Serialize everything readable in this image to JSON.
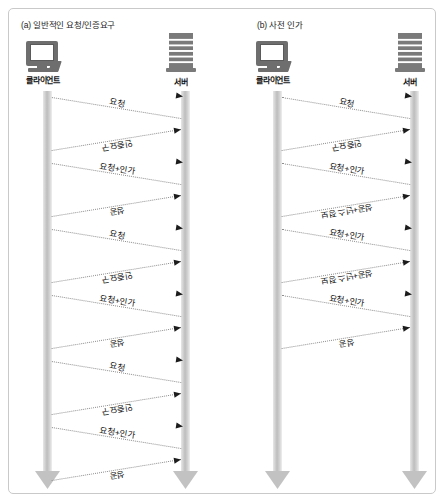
{
  "figure": {
    "background": "#ffffff",
    "border_color": "#c9c9c9",
    "lifeline_color": "#bdbdbd",
    "arrow_color": "#1c1c1c",
    "text_color": "#111111"
  },
  "panels": [
    {
      "id": "a",
      "title": "(a) 일반적인 요청/인증요구",
      "actors": {
        "client": {
          "label": "클라이언트",
          "icon": "monitor-icon"
        },
        "server": {
          "label": "서버",
          "icon": "server-rack-icon"
        }
      },
      "messages": [
        {
          "label": "요청",
          "direction": "client-to-server"
        },
        {
          "label": "인증요구",
          "direction": "server-to-client"
        },
        {
          "label": "요청+인가",
          "direction": "client-to-server"
        },
        {
          "label": "성공",
          "direction": "server-to-client"
        },
        {
          "label": "요청",
          "direction": "client-to-server"
        },
        {
          "label": "인증요구",
          "direction": "server-to-client"
        },
        {
          "label": "요청+인가",
          "direction": "client-to-server"
        },
        {
          "label": "성공",
          "direction": "server-to-client"
        },
        {
          "label": "요청",
          "direction": "client-to-server"
        },
        {
          "label": "인증요구",
          "direction": "server-to-client"
        },
        {
          "label": "요청+인가",
          "direction": "client-to-server"
        },
        {
          "label": "성공",
          "direction": "server-to-client"
        }
      ]
    },
    {
      "id": "b",
      "title": "(b) 사전 인가",
      "actors": {
        "client": {
          "label": "클라이언트",
          "icon": "monitor-icon"
        },
        "server": {
          "label": "서버",
          "icon": "server-rack-icon"
        }
      },
      "messages": [
        {
          "label": "요청",
          "direction": "client-to-server"
        },
        {
          "label": "인증요구",
          "direction": "server-to-client"
        },
        {
          "label": "요청+인가",
          "direction": "client-to-server"
        },
        {
          "label": "성공+넌스 정보",
          "direction": "server-to-client"
        },
        {
          "label": "요청+인가",
          "direction": "client-to-server"
        },
        {
          "label": "성공+넌스 정보",
          "direction": "server-to-client"
        },
        {
          "label": "요청+인가",
          "direction": "client-to-server"
        },
        {
          "label": "성공",
          "direction": "server-to-client"
        }
      ]
    }
  ],
  "geometry": {
    "panel_a": {
      "client_x": 34,
      "server_x": 172,
      "first_y": 88,
      "step": 33
    },
    "panel_b": {
      "client_x": 49,
      "server_x": 186,
      "first_y": 88,
      "step": 33
    },
    "lifeline_top": 82,
    "lifeline_bottom": 462
  }
}
